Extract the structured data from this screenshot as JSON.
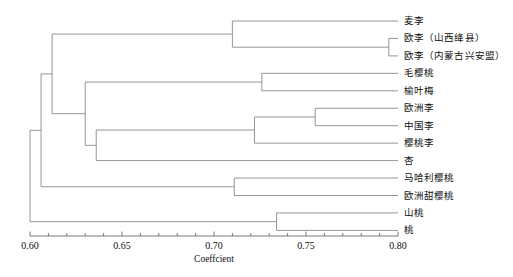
{
  "chart_data": {
    "type": "dendrogram",
    "title": "",
    "xlabel": "Coeffcient",
    "ylabel": "",
    "xlim": [
      0.6,
      0.8
    ],
    "grid": false,
    "legend": "none",
    "axis": {
      "tick_labels": [
        "0.60",
        "0.65",
        "0.70",
        "0.75",
        "0.80"
      ],
      "tick_values": [
        0.6,
        0.65,
        0.7,
        0.75,
        0.8
      ],
      "minor_tick_step": 0.01,
      "line_color": "#6b6b6b"
    },
    "leaves": [
      {
        "id": "maili",
        "label": "麦李",
        "order": 1
      },
      {
        "id": "ouli-shanxi",
        "label": "欧李（山西绛县）",
        "order": 2
      },
      {
        "id": "ouli-neimeng",
        "label": "欧李（内蒙古兴安盟）",
        "order": 3
      },
      {
        "id": "maoyingtao",
        "label": "毛樱桃",
        "order": 4
      },
      {
        "id": "yuyemei",
        "label": "榆叶梅",
        "order": 5
      },
      {
        "id": "ouzhouli",
        "label": "欧洲李",
        "order": 6
      },
      {
        "id": "zhongguoli",
        "label": "中国李",
        "order": 7
      },
      {
        "id": "yingtaoli",
        "label": "樱桃李",
        "order": 8
      },
      {
        "id": "xing",
        "label": "杏",
        "order": 9
      },
      {
        "id": "mahaliyingtao",
        "label": "马哈利樱桃",
        "order": 10
      },
      {
        "id": "outiantao",
        "label": "欧洲甜樱桃",
        "order": 11
      },
      {
        "id": "shantao",
        "label": "山桃",
        "order": 12
      },
      {
        "id": "tao",
        "label": "桃",
        "order": 13
      }
    ],
    "merges": [
      {
        "id": "n1",
        "children": [
          "ouli-shanxi",
          "ouli-neimeng"
        ],
        "coefficient": 0.795
      },
      {
        "id": "n2",
        "children": [
          "maili",
          "n1"
        ],
        "coefficient": 0.71
      },
      {
        "id": "n3",
        "children": [
          "maoyingtao",
          "yuyemei"
        ],
        "coefficient": 0.726
      },
      {
        "id": "n4",
        "children": [
          "ouzhouli",
          "zhongguoli"
        ],
        "coefficient": 0.755
      },
      {
        "id": "n5",
        "children": [
          "n4",
          "yingtaoli"
        ],
        "coefficient": 0.722
      },
      {
        "id": "n6",
        "children": [
          "n5",
          "xing"
        ],
        "coefficient": 0.636
      },
      {
        "id": "n7",
        "children": [
          "n3",
          "n6"
        ],
        "coefficient": 0.63
      },
      {
        "id": "n8",
        "children": [
          "n2",
          "n7"
        ],
        "coefficient": 0.612
      },
      {
        "id": "n9",
        "children": [
          "mahaliyingtao",
          "outiantao"
        ],
        "coefficient": 0.711
      },
      {
        "id": "n10",
        "children": [
          "n8",
          "n9"
        ],
        "coefficient": 0.606
      },
      {
        "id": "n11",
        "children": [
          "shantao",
          "tao"
        ],
        "coefficient": 0.734
      },
      {
        "id": "n12",
        "children": [
          "n10",
          "n11"
        ],
        "coefficient": 0.6
      }
    ],
    "line_color": "#8a8a8a"
  }
}
